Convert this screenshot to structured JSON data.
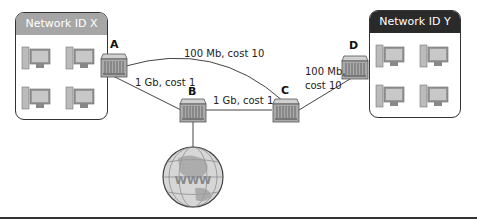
{
  "networks": [
    {
      "id": "x",
      "title": "Network ID X",
      "header_color": "#a6a6a6",
      "computers": 4
    },
    {
      "id": "y",
      "title": "Network ID Y",
      "header_color": "#2a2a2a",
      "computers": 4
    }
  ],
  "routers": [
    {
      "label": "A"
    },
    {
      "label": "B"
    },
    {
      "label": "C"
    },
    {
      "label": "D"
    }
  ],
  "links": [
    {
      "from": "A",
      "to": "C",
      "label": "100 Mb, cost 10"
    },
    {
      "from": "A",
      "to": "B",
      "label": "1 Gb, cost 1"
    },
    {
      "from": "B",
      "to": "C",
      "label": "1 Gb, cost 1"
    },
    {
      "from": "C",
      "to": "D",
      "label_line1": "100 Mb,",
      "label_line2": "cost 10"
    },
    {
      "from": "B",
      "to": "internet",
      "label": ""
    }
  ],
  "internet": {
    "icon": "globe-www-icon",
    "text": "WWW"
  }
}
